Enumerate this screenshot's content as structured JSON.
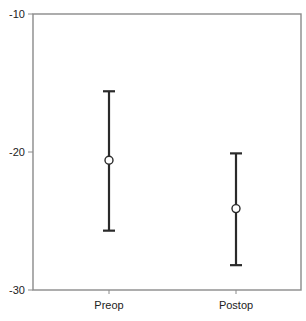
{
  "chart_data": {
    "type": "errorbar",
    "title": "",
    "xlabel": "",
    "ylabel": "",
    "categories": [
      "Preop",
      "Postop"
    ],
    "series": [
      {
        "name": "mean with error bars",
        "values": [
          -20.6,
          -24.1
        ],
        "upper": [
          -15.6,
          -20.1
        ],
        "lower": [
          -25.7,
          -28.2
        ]
      }
    ],
    "ylim": [
      -30,
      -10
    ],
    "yticks": [
      -10,
      -20,
      -30
    ],
    "ytick_labels": [
      "-10",
      "-20",
      "-30"
    ],
    "grid": false,
    "legend": null
  },
  "colors": {
    "frame": "#8a8a8a",
    "bar": "#2a2a2a",
    "marker_fill": "#ffffff",
    "marker_stroke": "#2a2a2a",
    "text": "#222222"
  }
}
